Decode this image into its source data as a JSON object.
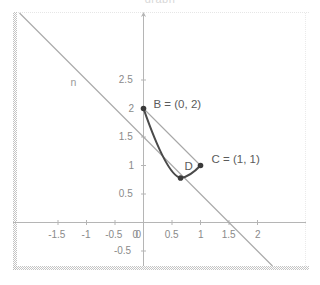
{
  "figure": {
    "caption": "graph",
    "type": "coordinate-geometry-plot"
  },
  "chart_data": {
    "type": "scatter",
    "title": "",
    "xlabel": "",
    "ylabel": "",
    "xlim": [
      -1.75,
      2.25
    ],
    "ylim": [
      -0.75,
      2.75
    ],
    "grid": false,
    "legend": "none",
    "x_ticks": [
      "-1.5",
      "-1",
      "-0.5",
      "0",
      "0.5",
      "1",
      "1.5",
      "2"
    ],
    "x_tick_values": [
      -1.5,
      -1,
      -0.5,
      0,
      0.5,
      1,
      1.5,
      2
    ],
    "y_ticks": [
      "-0.5",
      "0.5",
      "1",
      "1.5",
      "2",
      "2.5"
    ],
    "y_tick_values": [
      -0.5,
      0.5,
      1,
      1.5,
      2,
      2.5
    ],
    "points": [
      {
        "name": "B",
        "label": "B = (0, 2)",
        "x": 0,
        "y": 2,
        "label_dx": 10,
        "label_dy": -10
      },
      {
        "name": "C",
        "label": "C = (1, 1)",
        "x": 1,
        "y": 1,
        "label_dx": 11,
        "label_dy": -12
      },
      {
        "name": "D",
        "label": "D",
        "x": 0.65,
        "y": 0.78,
        "label_dx": 4,
        "label_dy": -17
      }
    ],
    "lines": [
      {
        "name": "n",
        "label": "n",
        "equation": "x + y = 1.5",
        "x_intercept": 1.5,
        "y_intercept": 1.5,
        "slope": -1,
        "style": "thin-gray",
        "label_x": -1.28,
        "label_y": 2.55
      },
      {
        "name": "chord-BC",
        "label": "",
        "from": "B",
        "to": "C",
        "style": "thin-gray"
      }
    ],
    "curves": [
      {
        "name": "arc-BDC",
        "label": "",
        "through": [
          "B",
          "D",
          "C"
        ],
        "style": "thick-dark",
        "description": "downward arc from B through D to C"
      }
    ]
  },
  "colors": {
    "axis": "#b5b5b5",
    "tick_text": "#8a8a8a",
    "point_label": "#5b5b5b",
    "line": "#a7a7a7",
    "curve": "#4a4a4a",
    "point": "#3a3a3a",
    "border": "#b9b9b9",
    "background": "#ffffff"
  }
}
